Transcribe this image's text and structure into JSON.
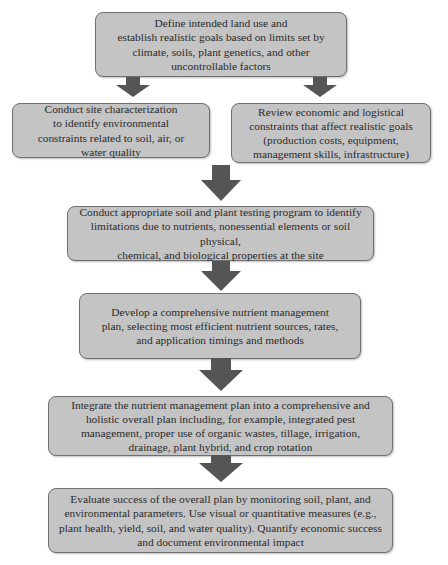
{
  "diagram": {
    "type": "flowchart",
    "colors": {
      "box_fill": "#c4c4c4",
      "box_border": "#6f6f6f",
      "arrow": "#555555",
      "background": "#ffffff"
    },
    "steps": [
      {
        "id": "define-goals",
        "lines": [
          "Define intended land use and",
          "establish realistic goals based on limits set by",
          "climate, soils, plant genetics, and other",
          "uncontrollable factors"
        ]
      },
      {
        "id": "site-characterization",
        "lines": [
          "Conduct site characterization",
          "to identify environmental",
          "constraints related to soil, air, or",
          "water quality"
        ]
      },
      {
        "id": "economic-constraints",
        "lines": [
          "Review economic and logistical",
          "constraints that affect realistic goals",
          "(production costs, equipment,",
          "management skills, infrastructure)"
        ]
      },
      {
        "id": "testing-program",
        "lines": [
          "Conduct appropriate soil and plant testing program to identify",
          "limitations due to nutrients, nonessential elements or soil physical,",
          "chemical, and biological properties at the site"
        ]
      },
      {
        "id": "nutrient-plan",
        "lines": [
          "Develop a comprehensive nutrient management",
          "plan, selecting most efficient nutrient sources, rates,",
          "and application timings and methods"
        ]
      },
      {
        "id": "integrate-plan",
        "lines": [
          "Integrate the nutrient management plan into a comprehensive and",
          "holistic overall plan including, for example, integrated pest",
          "management, proper use of organic wastes, tillage, irrigation,",
          "drainage, plant hybrid, and crop rotation"
        ]
      },
      {
        "id": "evaluate-success",
        "lines": [
          "Evaluate success of the overall plan by monitoring soil, plant, and",
          "environmental parameters. Use visual or quantitative measures (e.g.,",
          "plant health, yield, soil, and water quality). Quantify economic success",
          "and document environmental impact"
        ]
      }
    ],
    "edges": [
      [
        "define-goals",
        "site-characterization"
      ],
      [
        "define-goals",
        "economic-constraints"
      ],
      [
        "site-characterization",
        "testing-program"
      ],
      [
        "economic-constraints",
        "testing-program"
      ],
      [
        "testing-program",
        "nutrient-plan"
      ],
      [
        "nutrient-plan",
        "integrate-plan"
      ],
      [
        "integrate-plan",
        "evaluate-success"
      ]
    ]
  }
}
